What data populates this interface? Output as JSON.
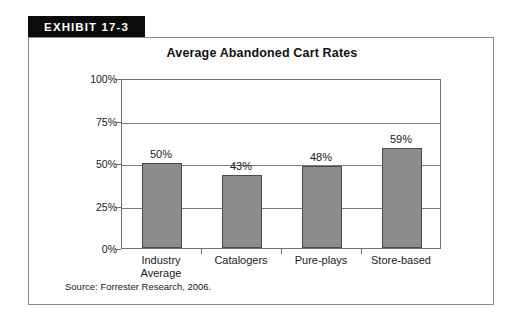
{
  "exhibit": {
    "banner_label": "EXHIBIT 17-3",
    "source_note": "Source: Forrester Research, 2006."
  },
  "chart_data": {
    "type": "bar",
    "title": "Average Abandoned Cart Rates",
    "xlabel": "",
    "ylabel": "",
    "categories": [
      "Industry Average",
      "Catalogers",
      "Pure-plays",
      "Store-based"
    ],
    "category_lines": [
      [
        "Industry",
        "Average"
      ],
      [
        "Catalogers"
      ],
      [
        "Pure-plays"
      ],
      [
        "Store-based"
      ]
    ],
    "values": [
      50,
      43,
      48,
      59
    ],
    "value_labels": [
      "50%",
      "43%",
      "48%",
      "59%"
    ],
    "ylim": [
      0,
      100
    ],
    "yticks": [
      0,
      25,
      50,
      75,
      100
    ],
    "ytick_labels": [
      "0%",
      "25%",
      "50%",
      "75%",
      "100%"
    ],
    "grid": true,
    "legend": "none",
    "bar_color": "#8c8c8c",
    "bar_border_color": "#4a4a4a",
    "axis_color": "#6e6e6e"
  }
}
